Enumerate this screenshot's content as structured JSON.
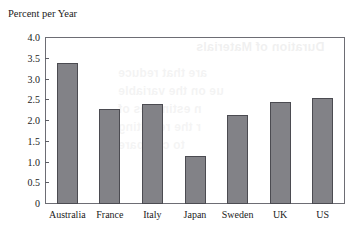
{
  "chart_data": {
    "type": "bar",
    "title": "Percent per Year",
    "xlabel": "",
    "ylabel": "Percent per Year",
    "categories": [
      "Australia",
      "France",
      "Italy",
      "Japan",
      "Sweden",
      "UK",
      "US"
    ],
    "values": [
      3.4,
      2.3,
      2.4,
      1.15,
      2.15,
      2.47,
      2.55
    ],
    "ylim": [
      0,
      4.0
    ],
    "ytick_labels": [
      "4.0",
      "3.5",
      "3.0",
      "2.5",
      "2.0",
      "1.5",
      "1.0",
      "0.5",
      "0"
    ],
    "ytick_values": [
      4.0,
      3.5,
      3.0,
      2.5,
      2.0,
      1.5,
      1.0,
      0.5,
      0
    ],
    "grid": false,
    "legend": null,
    "legend_position": "none",
    "bar_fill_color": "#828287",
    "bar_edge_color": "#4b4b51",
    "frame_color": "#6d6d74",
    "background_color": "#ffffff"
  },
  "figure": {
    "axis_title": "Percent per Year"
  },
  "bleed_through": {
    "line1": "Duration of Materials",
    "line2": "are that reduce",
    "line3": "ue on the variable",
    "line4": "n estimates of",
    "line5": "r the resulting",
    "line6": "to compare"
  }
}
